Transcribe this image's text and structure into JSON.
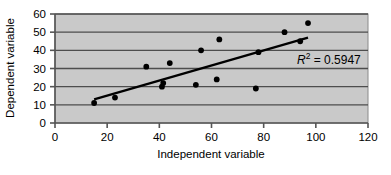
{
  "chart_data": {
    "type": "scatter",
    "title": "",
    "xlabel": "Independent variable",
    "ylabel": "Dependent variable",
    "xlim": [
      0,
      120
    ],
    "ylim": [
      0,
      60
    ],
    "xticks": [
      0,
      20,
      40,
      60,
      80,
      100,
      120
    ],
    "yticks": [
      0,
      10,
      20,
      30,
      40,
      50,
      60
    ],
    "grid": "horizontal",
    "plot_background": "#c9c9c9",
    "grid_color": "#4d4d4d",
    "marker_color": "#000000",
    "trendline_color": "#000000",
    "points": [
      {
        "x": 15,
        "y": 11
      },
      {
        "x": 23,
        "y": 14
      },
      {
        "x": 35,
        "y": 31
      },
      {
        "x": 41,
        "y": 20
      },
      {
        "x": 41.5,
        "y": 22
      },
      {
        "x": 44,
        "y": 33
      },
      {
        "x": 54,
        "y": 21
      },
      {
        "x": 56,
        "y": 40
      },
      {
        "x": 62,
        "y": 24
      },
      {
        "x": 63,
        "y": 46
      },
      {
        "x": 77,
        "y": 19
      },
      {
        "x": 78,
        "y": 39
      },
      {
        "x": 88,
        "y": 50
      },
      {
        "x": 94,
        "y": 45
      },
      {
        "x": 97,
        "y": 55
      }
    ],
    "trendline": {
      "x1": 15,
      "y1": 13,
      "x2": 97,
      "y2": 47
    },
    "annotation": {
      "r_symbol": "R",
      "exponent": "2",
      "equals_value": " = 0.5947",
      "full_text": "R2 = 0.5947"
    }
  },
  "ticklabels": {
    "x": [
      "0",
      "20",
      "40",
      "60",
      "80",
      "100",
      "120"
    ],
    "y": [
      "0",
      "10",
      "20",
      "30",
      "40",
      "50",
      "60"
    ]
  },
  "axis_titles": {
    "x": "Independent variable",
    "y": "Dependent variable"
  }
}
